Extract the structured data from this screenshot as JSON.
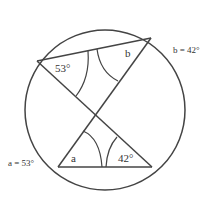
{
  "diagram": {
    "labels": {
      "angle_top_left": "53°",
      "angle_top_right": "b",
      "angle_bottom_left": "a",
      "angle_bottom_right": "42°",
      "result_b": "b = 42°",
      "result_a": "a = 53°"
    },
    "colors": {
      "stroke": "#444444",
      "text": "#333333"
    }
  }
}
